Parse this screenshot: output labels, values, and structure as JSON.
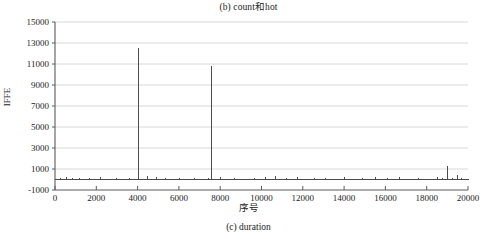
{
  "figure": {
    "title": "(b) count和hot",
    "caption": "(c) duration"
  },
  "chart_data": {
    "type": "line",
    "title": "(b) count和hot",
    "subtitle": "",
    "xlabel": "序号",
    "ylabel": "IFFE",
    "xlim": [
      0,
      20000
    ],
    "ylim": [
      -1000,
      15000
    ],
    "xticks": [
      0,
      2000,
      4000,
      6000,
      8000,
      10000,
      12000,
      14000,
      16000,
      18000,
      20000
    ],
    "yticks": [
      -1000,
      1000,
      3000,
      5000,
      7000,
      9000,
      11000,
      13000,
      15000
    ],
    "xtick_labels": [
      "0",
      "2000",
      "4000",
      "6000",
      "8000",
      "10000",
      "12000",
      "14000",
      "16000",
      "18000",
      "20000"
    ],
    "ytick_labels": [
      "-1000",
      "1000",
      "3000",
      "5000",
      "7000",
      "9000",
      "11000",
      "13000",
      "15000"
    ],
    "grid": "horizontal",
    "legend": "none",
    "series": [
      {
        "name": "duration",
        "color": "#4a4a4a",
        "baseline": 0,
        "x": [
          0,
          120,
          260,
          400,
          560,
          700,
          860,
          1020,
          1180,
          1340,
          1500,
          1680,
          1860,
          2040,
          2220,
          2400,
          2600,
          2800,
          3000,
          3200,
          3400,
          3620,
          3840,
          4050,
          4260,
          4480,
          4700,
          4920,
          5140,
          5360,
          5580,
          5800,
          6020,
          6260,
          6500,
          6740,
          6980,
          7220,
          7420,
          7600,
          7800,
          8000,
          8220,
          8440,
          8680,
          8920,
          9160,
          9400,
          9660,
          9920,
          10180,
          10440,
          10700,
          10960,
          11220,
          11480,
          11740,
          12000,
          12280,
          12560,
          12840,
          13120,
          13400,
          13700,
          14000,
          14300,
          14600,
          14900,
          15200,
          15500,
          15800,
          16100,
          16400,
          16700,
          17000,
          17300,
          17600,
          17900,
          18200,
          18500,
          18760,
          19000,
          19240,
          19480,
          19700,
          19900,
          20000
        ],
        "y": [
          20,
          40,
          160,
          35,
          250,
          60,
          120,
          45,
          180,
          55,
          90,
          140,
          50,
          70,
          210,
          45,
          60,
          95,
          170,
          40,
          55,
          130,
          60,
          12500,
          75,
          300,
          45,
          230,
          60,
          110,
          50,
          80,
          150,
          55,
          70,
          190,
          45,
          65,
          120,
          10800,
          55,
          260,
          80,
          45,
          130,
          60,
          95,
          40,
          170,
          50,
          210,
          65,
          340,
          55,
          120,
          45,
          230,
          80,
          60,
          150,
          45,
          190,
          70,
          55,
          260,
          90,
          45,
          130,
          60,
          200,
          50,
          110,
          45,
          280,
          70,
          55,
          160,
          45,
          90,
          200,
          120,
          1300,
          180,
          400,
          150,
          90,
          60
        ]
      }
    ],
    "peaks": [
      {
        "x": 4050,
        "y": 12500
      },
      {
        "x": 7600,
        "y": 10800
      },
      {
        "x": 19000,
        "y": 1300
      }
    ]
  },
  "plot_geometry": {
    "left_px": 55,
    "right_px": 468,
    "top_px": 22,
    "bottom_px": 190
  },
  "colors": {
    "line": "#4a4a4a",
    "axis": "#5a5a5a",
    "grid": "#d8d8d8",
    "text": "#1c1c1c",
    "background": "#ffffff"
  }
}
